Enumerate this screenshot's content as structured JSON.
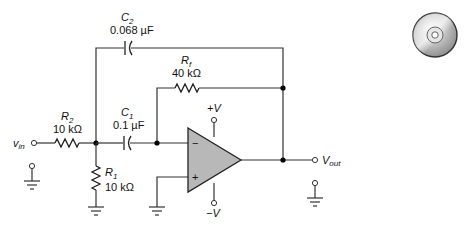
{
  "diagram": {
    "type": "active high-pass filter circuit (op-amp)",
    "components": {
      "c2": {
        "name": "C",
        "sub": "2",
        "value": "0.068 µF"
      },
      "rf": {
        "name": "R",
        "sub": "f",
        "value": "40 kΩ"
      },
      "c1": {
        "name": "C",
        "sub": "1",
        "value": "0.1 µF"
      },
      "r2": {
        "name": "R",
        "sub": "2",
        "value": "10 kΩ"
      },
      "r1": {
        "name": "R",
        "sub": "1",
        "value": "10 kΩ"
      }
    },
    "opamp": {
      "plus_supply": "+V",
      "minus_supply": "−V",
      "inverting": "−",
      "noninverting": "+"
    },
    "terminals": {
      "input": {
        "name": "v",
        "sub": "in"
      },
      "output": {
        "name": "V",
        "sub": "out"
      }
    },
    "colors": {
      "opamp_fill": "#b8b8b8",
      "wire": "#333333"
    }
  },
  "icon": {
    "name": "cd-disc-icon"
  }
}
